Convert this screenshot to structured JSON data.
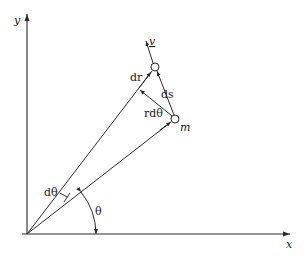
{
  "diagram": {
    "type": "polar-coordinates-kinematics",
    "axes": {
      "x_label": "x",
      "y_label": "y"
    },
    "labels": {
      "velocity": "v",
      "dr": "dr",
      "ds": "ds",
      "r_dtheta": "rdθ",
      "mass": "m",
      "d_theta": "dθ",
      "theta": "θ"
    },
    "colors": {
      "ink": "#2a2a2a",
      "background": "#ffffff"
    }
  }
}
